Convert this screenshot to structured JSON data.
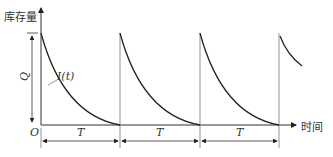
{
  "diagram": {
    "y_axis_label": "库存量",
    "x_axis_label": "时间",
    "origin_label": "O",
    "q_label": "Q",
    "curve_label": "I(t)",
    "period_labels": [
      "T",
      "T",
      "T"
    ],
    "cycles": 3,
    "partial_fourth_cycle": true,
    "colors": {
      "curve": "#222222",
      "axis": "#333333",
      "grid": "#999999"
    }
  }
}
